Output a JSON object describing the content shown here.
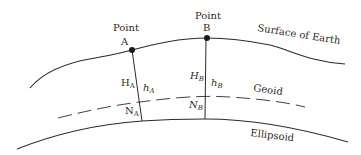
{
  "diagram": {
    "type": "geodetic-height-relationships",
    "colors": {
      "line": "#2b2b2b",
      "point": "#1a1a1a",
      "background": "#ffffff"
    },
    "points": [
      {
        "name": "Point",
        "letter": "A"
      },
      {
        "name": "Point",
        "letter": "B"
      }
    ],
    "surfaces": {
      "surface": "Surface of Earth",
      "geoid": "Geoid",
      "ellipsoid": "Ellipsoid"
    },
    "heights": {
      "orthometric_A": {
        "symbol": "H",
        "sub": "A"
      },
      "ellipsoidal_A": {
        "symbol": "h",
        "sub": "A"
      },
      "geoid_A": {
        "symbol": "N",
        "sub": "A"
      },
      "orthometric_B": {
        "symbol": "H",
        "sub": "B"
      },
      "ellipsoidal_B": {
        "symbol": "h",
        "sub": "B"
      },
      "geoid_B": {
        "symbol": "N",
        "sub": "B"
      }
    }
  }
}
